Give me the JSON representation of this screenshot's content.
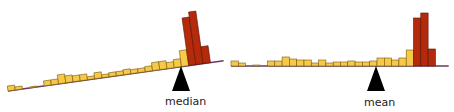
{
  "colors": {
    "low_bar": "#f7c948",
    "high_bar": "#b52a0b",
    "bar_stroke": "#7a5a10",
    "high_stroke": "#5a1204",
    "baseline": "#6a3a5a",
    "fulcrum": "#000000"
  },
  "panels": [
    {
      "id": "left",
      "label": "median",
      "balance": "tilted"
    },
    {
      "id": "right",
      "label": "mean",
      "balance": "level"
    }
  ],
  "chart_data": [
    {
      "type": "bar",
      "title": "Histogram balanced on median (tilts)",
      "annotation": "median",
      "categories": [
        "1",
        "2",
        "3",
        "4",
        "5",
        "6",
        "7",
        "8",
        "9",
        "10",
        "11",
        "12",
        "13",
        "14",
        "15",
        "16",
        "17",
        "18",
        "19",
        "20",
        "21",
        "22",
        "23",
        "24",
        "25",
        "26",
        "27",
        "28",
        "29"
      ],
      "values": [
        5,
        3,
        0,
        1,
        0,
        5,
        5,
        9,
        7,
        6,
        6,
        3,
        6,
        3,
        4,
        4,
        5,
        4,
        4,
        5,
        8,
        8,
        6,
        8,
        16,
        48,
        53,
        17,
        0
      ],
      "highlight_from_index": 25,
      "fulcrum_bin": 24.5,
      "tilt_degrees": -8
    },
    {
      "type": "bar",
      "title": "Histogram balanced on mean (level)",
      "annotation": "mean",
      "categories": [
        "1",
        "2",
        "3",
        "4",
        "5",
        "6",
        "7",
        "8",
        "9",
        "10",
        "11",
        "12",
        "13",
        "14",
        "15",
        "16",
        "17",
        "18",
        "19",
        "20",
        "21",
        "22",
        "23",
        "24",
        "25",
        "26",
        "27",
        "28",
        "29"
      ],
      "values": [
        5,
        3,
        0,
        1,
        0,
        5,
        5,
        9,
        7,
        6,
        6,
        3,
        6,
        3,
        4,
        4,
        5,
        4,
        4,
        5,
        8,
        8,
        6,
        8,
        16,
        48,
        53,
        17,
        0
      ],
      "highlight_from_index": 25,
      "fulcrum_bin": 20,
      "tilt_degrees": 0
    }
  ]
}
